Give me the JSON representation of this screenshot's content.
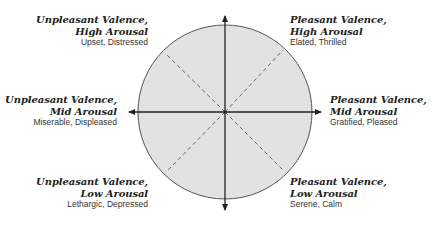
{
  "diagram": {
    "type": "circumplex model of affect",
    "axes": {
      "horizontal": "valence (unpleasant ← → pleasant)",
      "vertical": "arousal (low ↓ ↑ high)"
    },
    "colors": {
      "circle_fill": "#e2e2e2",
      "circle_stroke": "#555555",
      "axis": "#222222",
      "dashed": "#666666"
    },
    "quadrants": {
      "top_left": {
        "title_line1": "Unpleasant Valence,",
        "title_line2": "High Arousal",
        "examples": "Upset, Distressed"
      },
      "top_right": {
        "title_line1": "Pleasant Valence,",
        "title_line2": "High Arousal",
        "examples": "Elated, Thrilled"
      },
      "mid_left": {
        "title_line1": "Unpleasant Valence,",
        "title_line2": "Mid Arousal",
        "examples": "Miserable, Displeased"
      },
      "mid_right": {
        "title_line1": "Pleasant Valence,",
        "title_line2": "Mid Arousal",
        "examples": "Gratified, Pleased"
      },
      "bottom_left": {
        "title_line1": "Unpleasant Valence,",
        "title_line2": "Low Arousal",
        "examples": "Lethargic, Depressed"
      },
      "bottom_right": {
        "title_line1": "Pleasant Valence,",
        "title_line2": "Low Arousal",
        "examples": "Serene, Calm"
      }
    }
  }
}
